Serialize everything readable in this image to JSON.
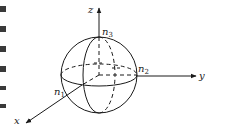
{
  "figure": {
    "type": "coordinate-system-sphere",
    "colors": {
      "stroke": "#1a1a1a",
      "background": "#ffffff"
    },
    "axes": {
      "z": {
        "label": "z"
      },
      "y": {
        "label": "y"
      },
      "x": {
        "label": "x"
      }
    },
    "points": {
      "n1": {
        "base": "n",
        "sub": "1"
      },
      "n2": {
        "base": "n",
        "sub": "2"
      },
      "n3": {
        "base": "n",
        "sub": "3"
      }
    }
  }
}
